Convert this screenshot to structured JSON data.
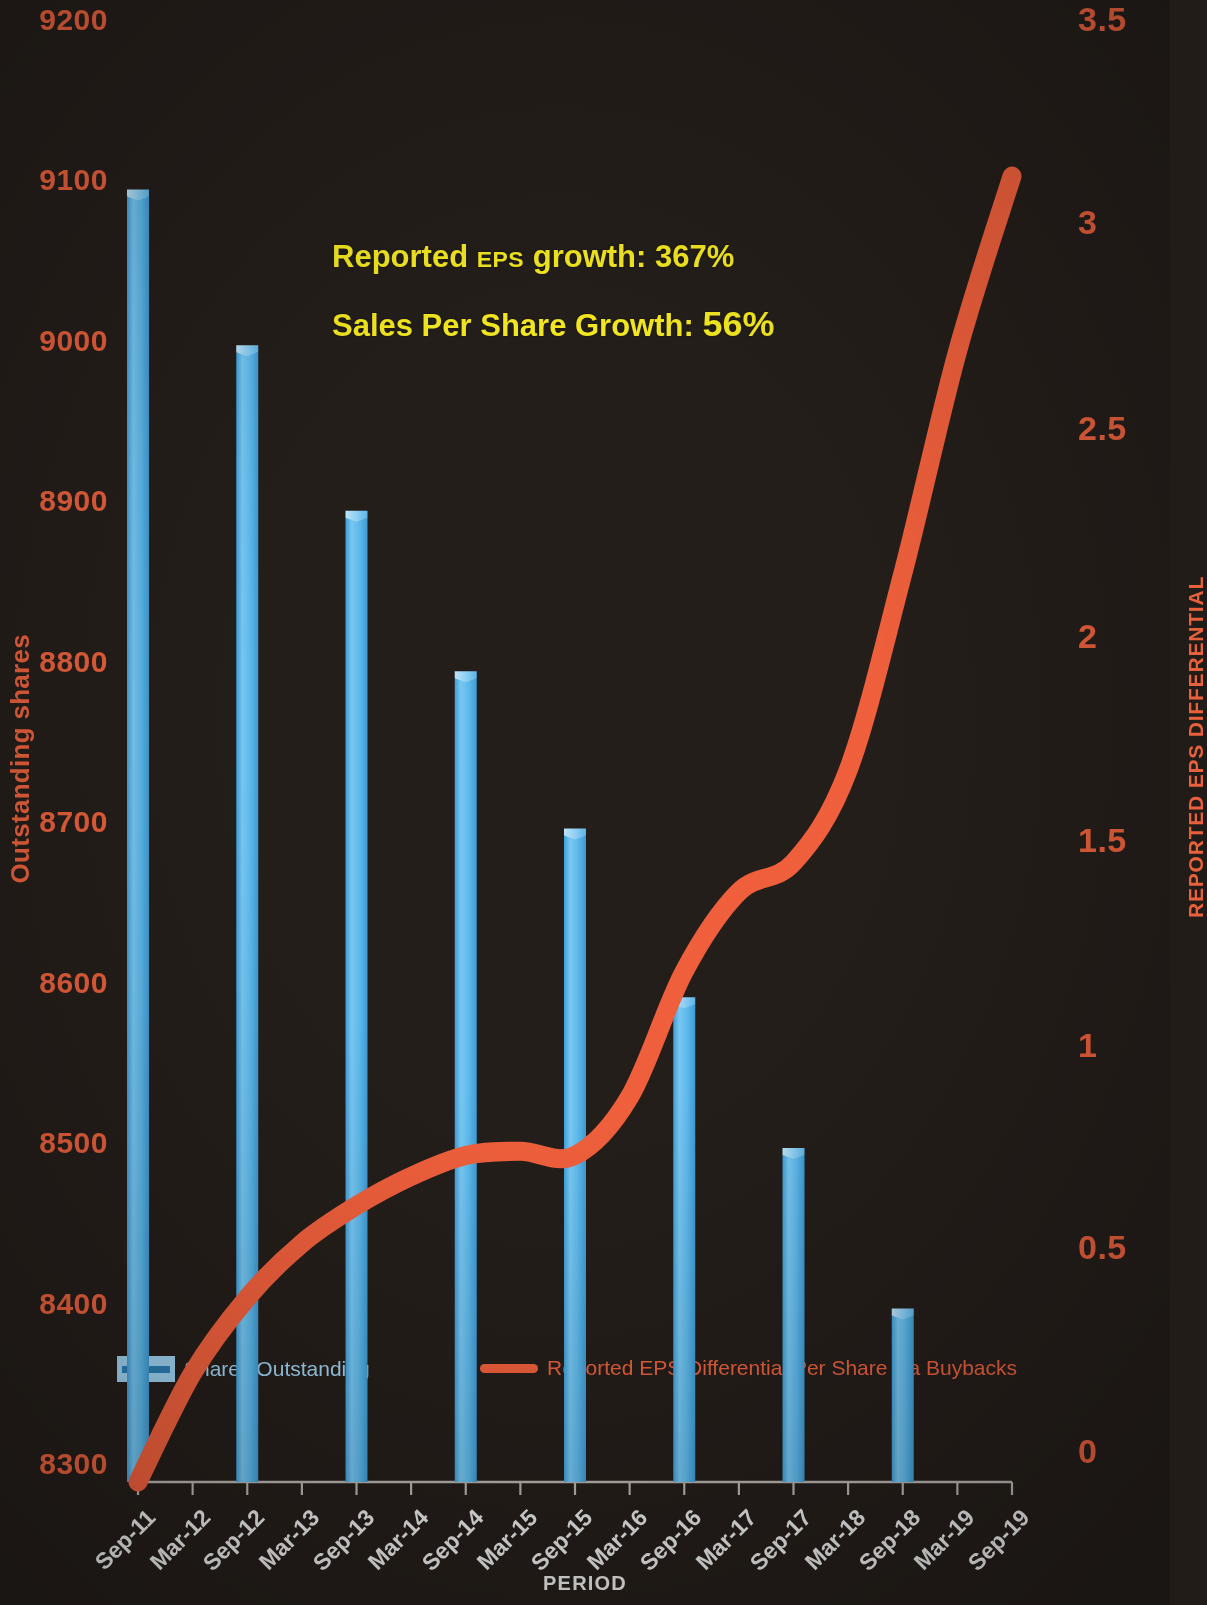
{
  "chart_data": {
    "type": "bar",
    "title": "",
    "xlabel": "PERIOD",
    "ylabel": "Outstanding shares",
    "y2label": "REPORTED EPS DIFFERENTIAL",
    "grid": false,
    "legend_position": "bottom",
    "categories": [
      "Sep-11",
      "Mar-12",
      "Sep-12",
      "Mar-13",
      "Sep-13",
      "Mar-14",
      "Sep-14",
      "Mar-15",
      "Sep-15",
      "Mar-16",
      "Sep-16",
      "Mar-17",
      "Sep-17",
      "Mar-18",
      "Sep-18",
      "Mar-19",
      "Sep-19"
    ],
    "ylim": [
      8300,
      9200
    ],
    "yticks": [
      "8300",
      "8400",
      "8500",
      "8600",
      "8700",
      "8800",
      "8900",
      "9000",
      "9100",
      "9200"
    ],
    "y2lim": [
      0,
      3.5
    ],
    "y2ticks": [
      "0",
      "0.5",
      "1",
      "1.5",
      "2",
      "2.5",
      "3",
      "3.5"
    ],
    "series": [
      {
        "name": "Shares Outstanding",
        "type": "bar",
        "axis": "left",
        "color": "#5BB8EE",
        "x": [
          "Sep-11",
          "Sep-12",
          "Sep-13",
          "Sep-14",
          "Sep-15",
          "Sep-16",
          "Sep-17",
          "Sep-18"
        ],
        "values": [
          9105,
          9008,
          8905,
          8805,
          8707,
          8602,
          8508,
          8408
        ]
      },
      {
        "name": "Reported EPS Differential Per Share via Buybacks",
        "type": "line",
        "axis": "right",
        "color": "#F0603C",
        "x": [
          "Sep-11",
          "Mar-12",
          "Sep-12",
          "Mar-13",
          "Sep-13",
          "Mar-14",
          "Sep-14",
          "Mar-15",
          "Sep-15",
          "Mar-16",
          "Sep-16",
          "Mar-17",
          "Sep-17",
          "Mar-18",
          "Sep-18",
          "Mar-19",
          "Sep-19"
        ],
        "values": [
          0.0,
          0.26,
          0.44,
          0.57,
          0.66,
          0.73,
          0.78,
          0.79,
          0.78,
          0.92,
          1.22,
          1.41,
          1.48,
          1.7,
          2.17,
          2.7,
          3.12
        ]
      }
    ],
    "annotations": [
      {
        "text_prefix": "Reported ",
        "text_small": "EPS",
        "text_mid": " growth: ",
        "text_big": "367%",
        "color": "#F2E720"
      },
      {
        "text_prefix": "Sales Per  Share Growth: ",
        "text_small": "",
        "text_mid": "",
        "text_big": "56%",
        "color": "#F2E720"
      }
    ]
  },
  "axes": {
    "left_title": "Outstanding shares",
    "right_title": "REPORTED EPS DIFFERENTIAL",
    "bottom_title": "PERIOD",
    "left_ticks": [
      "9200",
      "9100",
      "9000",
      "8900",
      "8800",
      "8700",
      "8600",
      "8500",
      "8400",
      "8300"
    ],
    "right_ticks": [
      "3.5",
      "3",
      "2.5",
      "2",
      "1.5",
      "1",
      "0.5",
      "0"
    ],
    "x_ticks": [
      "Sep-11",
      "Mar-12",
      "Sep-12",
      "Mar-13",
      "Sep-13",
      "Mar-14",
      "Sep-14",
      "Mar-15",
      "Sep-15",
      "Mar-16",
      "Sep-16",
      "Mar-17",
      "Sep-17",
      "Mar-18",
      "Sep-18",
      "Mar-19",
      "Sep-19"
    ]
  },
  "annotations": {
    "line1_a": "Reported ",
    "line1_b": "EPS",
    "line1_c": " growth: ",
    "line1_d": "367%",
    "line2_a": "Sales Per  Share Growth: ",
    "line2_d": "56%"
  },
  "legend": {
    "bars_label": "Shares Outstanding",
    "line_label": "Reported EPS Differential Per Share via Buybacks"
  },
  "colors": {
    "background": "#241e1a",
    "bar": "#5BB8EE",
    "line": "#F0603C",
    "axis_text_left": "#E8603C",
    "axis_text_right": "#E8603C",
    "annotation": "#F2E720",
    "x_tick_text": "#e9e9e9"
  }
}
